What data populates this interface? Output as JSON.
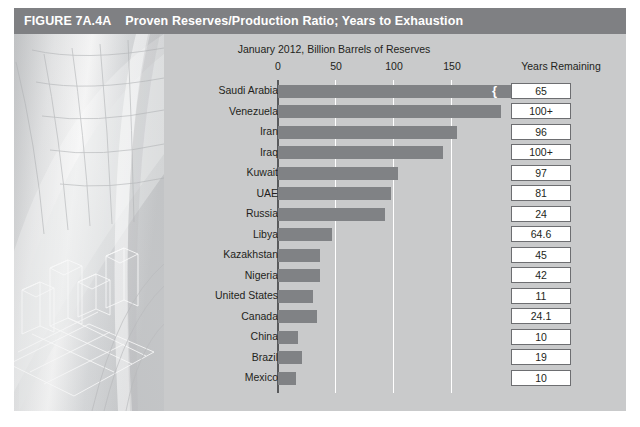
{
  "figure": {
    "number": "FIGURE 7A.4A",
    "title": "Proven Reserves/Production Ratio; Years to Exhaustion",
    "header_color": "#7f8083",
    "panel_color": "#c9cacb",
    "bar_color": "#808285"
  },
  "chart_data": {
    "type": "bar",
    "orientation": "horizontal",
    "title": "January 2012, Billion Barrels of Reserves",
    "xlabel": "",
    "ylabel": "",
    "xlim": [
      0,
      200
    ],
    "xticks": [
      0,
      50,
      100,
      150
    ],
    "xtick_labels": [
      "0",
      "50",
      "100",
      "150"
    ],
    "grid": true,
    "legend": null,
    "secondary_column_header": "Years Remaining",
    "categories": [
      "Saudi Arabia",
      "Venezuela",
      "Iran",
      "Iraq",
      "Kuwait",
      "UAE",
      "Russia",
      "Libya",
      "Kazakhstan",
      "Nigeria",
      "United States",
      "Canada",
      "China",
      "Brazil",
      "Mexico"
    ],
    "values": [
      265,
      193,
      155,
      143,
      104,
      98,
      93,
      47,
      37,
      37,
      31,
      34,
      18,
      21,
      16
    ],
    "value_labels": [
      "265",
      "",
      "",
      "",
      "",
      "",
      "",
      "",
      "",
      "",
      "",
      "",
      "",
      "",
      ""
    ],
    "axis_break_at": [
      "Saudi Arabia"
    ],
    "years_remaining": [
      "65",
      "100+",
      "96",
      "100+",
      "97",
      "81",
      "24",
      "64.6",
      "45",
      "42",
      "11",
      "24.1",
      "10",
      "19",
      "10"
    ]
  }
}
